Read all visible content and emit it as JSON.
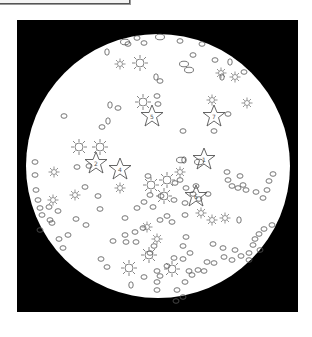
{
  "image": {
    "description": "Circular microscope-style field of view on a black square, containing outlined stars (labeled), sun-burst shapes, and small oval particles",
    "background_color": "#000000",
    "field_color": "#ffffff",
    "outline_color": "#555555"
  },
  "stars": [
    {
      "label": "5",
      "x": 152,
      "y": 116
    },
    {
      "label": "7",
      "x": 214,
      "y": 116
    },
    {
      "label": "2",
      "x": 96,
      "y": 163
    },
    {
      "label": "4",
      "x": 120,
      "y": 169
    },
    {
      "label": "1",
      "x": 204,
      "y": 159
    },
    {
      "label": "6",
      "x": 196,
      "y": 196
    }
  ]
}
